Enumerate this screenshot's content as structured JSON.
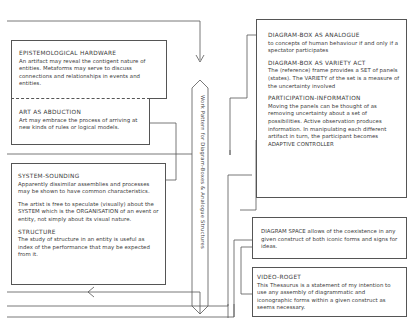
{
  "diagram": {
    "vertical_label": "Work Pattern for Diagram-Boxes & Analogue Structures",
    "left": {
      "epistemological": {
        "title": "EPISTEMOLOGICAL HARDWARE",
        "body": "An artifact may reveal the contigent nature of entities. Metaforms may serve to discuss connections and relationships in events and entities."
      },
      "abduction": {
        "title": "ART AS ABDUCTION",
        "body": "Art may embrace the process of arriving at new kinds of rules or logical models."
      },
      "system": {
        "title": "SYSTEM-SOUNDING",
        "body1": "Apparently dissimilar assemblies and processes may be shown to have common characteristics.",
        "body2": "The artist is free to speculate (visually) about the SYSTEM which is the ORGANISATION of an event or entity, not simply about its visual nature.",
        "structure_title": "STRUCTURE",
        "structure_body": "The study of structure in an entity is useful as index of the performance that may be expected from it."
      }
    },
    "right": {
      "analogue": {
        "title": "DIAGRAM-BOX AS ANALOGUE",
        "body": "to concepts of human behaviour if and only if a spectator participates"
      },
      "variety": {
        "title": "DIAGRAM-BOX AS VARIETY ACT",
        "body": "The (reference) frame provides a SET of panels (states). The VARIETY of the set is a measure of the uncertainty involved"
      },
      "participation": {
        "title": "PARTICIPATION-INFORMATION",
        "body": "Moving the panels can be thought of as removing uncertainty about a set of possibilities. Active observation produces information. In manipulating each different artifact in turn, the participant becomes ADAPTIVE CONTROLLER"
      },
      "space": {
        "body": "DIAGRAM SPACE allows of the coexistence in any given construct of both iconic forms and signs for ideas."
      },
      "roget": {
        "title": "VIDEO-ROGET",
        "body": "This Thesaurus is a statement of my intention to use any assembly of diagrammatic and iconographic forms within a given construct as seems necessary."
      }
    }
  }
}
